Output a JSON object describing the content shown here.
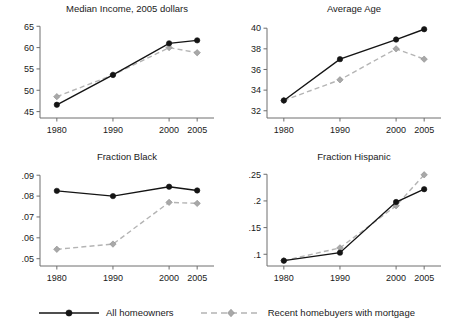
{
  "figure": {
    "legend": {
      "entries": [
        {
          "label": "All homeowners",
          "style": "solid",
          "marker": "circle",
          "color": "#141414"
        },
        {
          "label": "Recent homebuyers with mortgage",
          "style": "dashed",
          "marker": "diamond",
          "color": "#a8a8a8"
        }
      ]
    }
  },
  "chart_data": [
    {
      "type": "line",
      "panel": "top-left",
      "title": "Median Income, 2005 dollars",
      "xlabel": "",
      "ylabel": "",
      "x": [
        1980,
        1990,
        2000,
        2005
      ],
      "xticklabels": [
        "1980",
        "1990",
        "2000",
        "2005"
      ],
      "yticks": [
        45,
        50,
        55,
        60,
        65
      ],
      "yticklabels": [
        "45",
        "50",
        "55",
        "60",
        "65"
      ],
      "ylim": [
        43.5,
        66.0
      ],
      "xlim": [
        1977,
        2008
      ],
      "grid": false,
      "legend_position": "figure-bottom-center",
      "series": [
        {
          "name": "All homeowners",
          "style": "solid",
          "marker": "circle",
          "color": "#141414",
          "values": [
            46.6,
            53.6,
            61.0,
            61.7
          ]
        },
        {
          "name": "Recent homebuyers with mortgage",
          "style": "dashed",
          "marker": "diamond",
          "color": "#a8a8a8",
          "values": [
            48.5,
            53.6,
            60.0,
            58.8
          ]
        }
      ]
    },
    {
      "type": "line",
      "panel": "top-right",
      "title": "Average Age",
      "xlabel": "",
      "ylabel": "",
      "x": [
        1980,
        1990,
        2000,
        2005
      ],
      "xticklabels": [
        "1980",
        "1990",
        "2000",
        "2005"
      ],
      "yticks": [
        32,
        34,
        36,
        38,
        40
      ],
      "yticklabels": [
        "32",
        "34",
        "36",
        "38",
        "40"
      ],
      "ylim": [
        31.3,
        40.6
      ],
      "xlim": [
        1977,
        2008
      ],
      "grid": false,
      "legend_position": "figure-bottom-center",
      "series": [
        {
          "name": "All homeowners",
          "style": "solid",
          "marker": "circle",
          "color": "#141414",
          "values": [
            33.0,
            37.0,
            38.9,
            39.9
          ]
        },
        {
          "name": "Recent homebuyers with mortgage",
          "style": "dashed",
          "marker": "diamond",
          "color": "#a8a8a8",
          "values": [
            33.0,
            35.0,
            38.0,
            37.0
          ]
        }
      ]
    },
    {
      "type": "line",
      "panel": "bottom-left",
      "title": "Fraction Black",
      "xlabel": "",
      "ylabel": "",
      "x": [
        1980,
        1990,
        2000,
        2005
      ],
      "xticklabels": [
        "1980",
        "1990",
        "2000",
        "2005"
      ],
      "yticks": [
        0.05,
        0.06,
        0.07,
        0.08,
        0.09
      ],
      "yticklabels": [
        ".05",
        ".06",
        ".07",
        ".08",
        ".09"
      ],
      "ylim": [
        0.0465,
        0.0925
      ],
      "xlim": [
        1977,
        2008
      ],
      "grid": false,
      "legend_position": "figure-bottom-center",
      "series": [
        {
          "name": "All homeowners",
          "style": "solid",
          "marker": "circle",
          "color": "#141414",
          "values": [
            0.0825,
            0.08,
            0.0845,
            0.0827
          ]
        },
        {
          "name": "Recent homebuyers with mortgage",
          "style": "dashed",
          "marker": "diamond",
          "color": "#a8a8a8",
          "values": [
            0.0545,
            0.057,
            0.077,
            0.0765
          ]
        }
      ]
    },
    {
      "type": "line",
      "panel": "bottom-right",
      "title": "Fraction Hispanic",
      "xlabel": "",
      "ylabel": "",
      "x": [
        1980,
        1990,
        2000,
        2005
      ],
      "xticklabels": [
        "1980",
        "1990",
        "2000",
        "2005"
      ],
      "yticks": [
        0.1,
        0.15,
        0.2,
        0.25
      ],
      "yticklabels": [
        ".1",
        ".15",
        ".2",
        ".25"
      ],
      "ylim": [
        0.078,
        0.258
      ],
      "xlim": [
        1977,
        2008
      ],
      "grid": false,
      "legend_position": "figure-bottom-center",
      "series": [
        {
          "name": "All homeowners",
          "style": "solid",
          "marker": "circle",
          "color": "#141414",
          "values": [
            0.088,
            0.103,
            0.198,
            0.222
          ]
        },
        {
          "name": "Recent homebuyers with mortgage",
          "style": "dashed",
          "marker": "diamond",
          "color": "#a8a8a8",
          "values": [
            0.088,
            0.112,
            0.191,
            0.249
          ]
        }
      ]
    }
  ]
}
